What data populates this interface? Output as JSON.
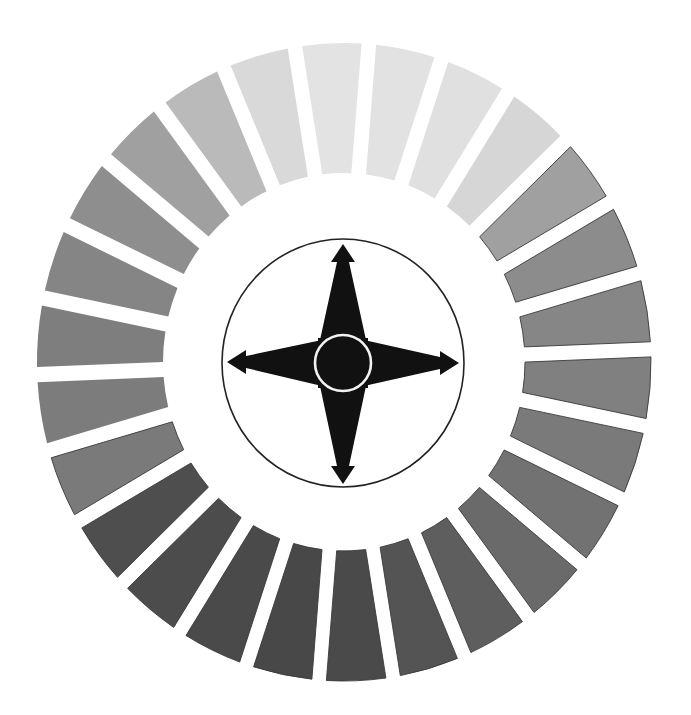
{
  "diagram": {
    "title": "",
    "ring": {
      "segment_count": 26,
      "start_gap_angle_deg": -9.2,
      "segments": [
        {
          "index": 0,
          "fill": "#e3e3e3"
        },
        {
          "index": 1,
          "fill": "#e2e2e2"
        },
        {
          "index": 2,
          "fill": "#e0e0e0"
        },
        {
          "index": 3,
          "fill": "#d6d6d6"
        },
        {
          "index": 4,
          "fill": "#a0a0a0"
        },
        {
          "index": 5,
          "fill": "#8c8c8c"
        },
        {
          "index": 6,
          "fill": "#868686"
        },
        {
          "index": 7,
          "fill": "#808080"
        },
        {
          "index": 8,
          "fill": "#7a7a7a"
        },
        {
          "index": 9,
          "fill": "#727272"
        },
        {
          "index": 10,
          "fill": "#6a6a6a"
        },
        {
          "index": 11,
          "fill": "#5e5e5e"
        },
        {
          "index": 12,
          "fill": "#545454"
        },
        {
          "index": 13,
          "fill": "#4a4a4a"
        },
        {
          "index": 14,
          "fill": "#484848"
        },
        {
          "index": 15,
          "fill": "#4a4a4a"
        },
        {
          "index": 16,
          "fill": "#4c4c4c"
        },
        {
          "index": 17,
          "fill": "#4e4e4e"
        },
        {
          "index": 18,
          "fill": "#7a7a7a"
        },
        {
          "index": 19,
          "fill": "#7c7c7c"
        },
        {
          "index": 20,
          "fill": "#7e7e7e"
        },
        {
          "index": 21,
          "fill": "#858585"
        },
        {
          "index": 22,
          "fill": "#8e8e8e"
        },
        {
          "index": 23,
          "fill": "#a0a0a0"
        },
        {
          "index": 24,
          "fill": "#bababa"
        },
        {
          "index": 25,
          "fill": "#d9d9d9"
        }
      ],
      "gap_color": "#ffffff",
      "outline_color": "#3a3a3a"
    },
    "compass": {
      "directions": [
        "north",
        "east",
        "south",
        "west"
      ],
      "star_fill": "#111111",
      "outer_circle_stroke": "#222222",
      "center_ring_stroke": "#f2f2f2"
    }
  }
}
